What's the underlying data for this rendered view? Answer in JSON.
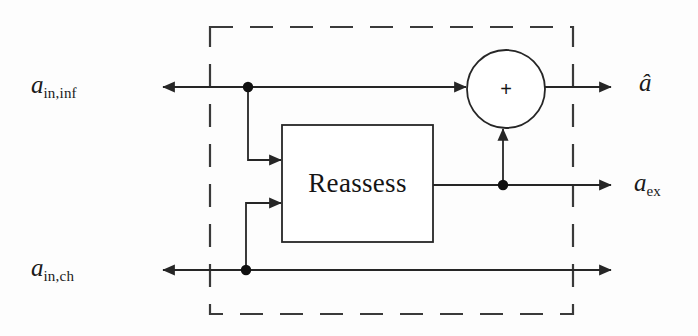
{
  "diagram": {
    "stroke_color": "#262626",
    "background_color": "#fdfdfd",
    "dashed_boundary": {
      "name": "system-boundary",
      "style": "dashed",
      "x": 210,
      "y": 27,
      "width": 363,
      "height": 287
    },
    "inputs": [
      {
        "id": "a_in_inf",
        "var": "a",
        "subscript": "in,inf",
        "y": 87
      },
      {
        "id": "a_in_ch",
        "var": "a",
        "subscript": "in,ch",
        "y": 270
      }
    ],
    "outputs": [
      {
        "id": "a_hat",
        "var": "â",
        "subscript": "",
        "y": 87
      },
      {
        "id": "a_ex",
        "var": "a",
        "subscript": "ex",
        "y": 185
      }
    ],
    "blocks": [
      {
        "id": "reassess",
        "label": "Reassess",
        "shape": "rectangle",
        "x": 282,
        "y": 125,
        "width": 151,
        "height": 117
      }
    ],
    "nodes": [
      {
        "id": "sum",
        "label": "+",
        "shape": "circle",
        "cx": 506,
        "cy": 89,
        "r": 39
      }
    ],
    "junctions": [
      {
        "id": "junction-in-inf",
        "cx": 248,
        "cy": 87
      },
      {
        "id": "junction-in-ch",
        "cx": 246,
        "cy": 270
      },
      {
        "id": "junction-a-ex",
        "cx": 503,
        "cy": 185
      }
    ],
    "edges": [
      {
        "id": "edge-in-inf-to-sum",
        "from": "a_in_inf",
        "to": "sum"
      },
      {
        "id": "edge-in-inf-to-reassess",
        "from": "junction-in-inf",
        "to": "reassess"
      },
      {
        "id": "edge-in-ch-to-reassess",
        "from": "junction-in-ch",
        "to": "reassess"
      },
      {
        "id": "edge-in-ch-to-output",
        "from": "a_in_ch",
        "to": "bottom-output"
      },
      {
        "id": "edge-reassess-to-a-ex",
        "from": "reassess",
        "to": "a_ex"
      },
      {
        "id": "edge-a-ex-to-sum",
        "from": "junction-a-ex",
        "to": "sum"
      },
      {
        "id": "edge-sum-to-a-hat",
        "from": "sum",
        "to": "a_hat"
      }
    ]
  }
}
